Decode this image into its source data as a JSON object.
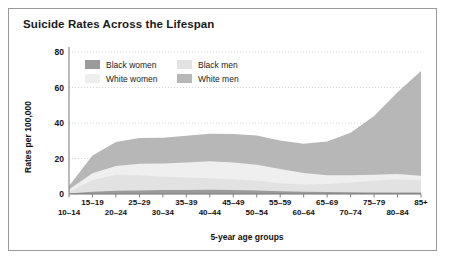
{
  "title": "Suicide Rates Across the Lifespan",
  "legend": {
    "items": [
      {
        "label": "Black women",
        "color": "#9b9b9b"
      },
      {
        "label": "Black men",
        "color": "#e2e2e2"
      },
      {
        "label": "White women",
        "color": "#efefef"
      },
      {
        "label": "White men",
        "color": "#b7b7b7"
      }
    ]
  },
  "chart_data": {
    "type": "area",
    "stacked": true,
    "title": "Suicide Rates Across the Lifespan",
    "xlabel": "5-year age groups",
    "ylabel": "Rates per 100,000",
    "grid": true,
    "legend_position": "top-left-inside",
    "ylim": [
      0,
      80
    ],
    "yticks": [
      0,
      20,
      40,
      60,
      80
    ],
    "categories": [
      "10–14",
      "15–19",
      "20–24",
      "25–29",
      "30–34",
      "35–39",
      "40–44",
      "45–49",
      "50–54",
      "55–59",
      "60–64",
      "65–69",
      "70–74",
      "75–79",
      "80–84",
      "85+"
    ],
    "series": [
      {
        "name": "Black women",
        "color": "#9b9b9b",
        "values": [
          0.3,
          1.2,
          1.8,
          2.0,
          2.2,
          2.3,
          2.4,
          2.3,
          2.0,
          1.6,
          1.3,
          1.1,
          1.0,
          0.9,
          0.8,
          0.8
        ]
      },
      {
        "name": "Black men",
        "color": "#e2e2e2",
        "values": [
          1.0,
          6.5,
          9.0,
          8.5,
          7.5,
          7.0,
          6.5,
          6.0,
          5.5,
          4.5,
          4.0,
          4.5,
          5.5,
          6.5,
          7.5,
          7.0
        ]
      },
      {
        "name": "White women",
        "color": "#efefef",
        "values": [
          1.2,
          4.0,
          5.0,
          6.5,
          7.5,
          8.5,
          9.5,
          9.5,
          9.0,
          8.0,
          6.5,
          5.0,
          4.0,
          3.5,
          3.0,
          2.5
        ]
      },
      {
        "name": "White men",
        "color": "#b7b7b7",
        "values": [
          2.0,
          10.0,
          13.5,
          14.5,
          14.5,
          15.0,
          15.5,
          16.0,
          16.5,
          16.0,
          16.5,
          19.0,
          24.0,
          33.0,
          46.0,
          59.0
        ]
      }
    ]
  }
}
